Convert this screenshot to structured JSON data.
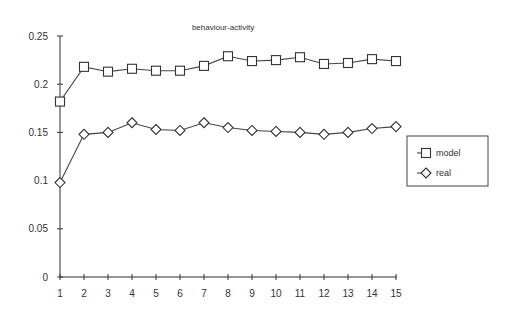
{
  "chart_data": {
    "type": "line",
    "title": "behaviour-activity",
    "xlabel": "",
    "ylabel": "",
    "x": [
      1,
      2,
      3,
      4,
      5,
      6,
      7,
      8,
      9,
      10,
      11,
      12,
      13,
      14,
      15
    ],
    "xlim": [
      1,
      15
    ],
    "ylim": [
      0,
      0.25
    ],
    "yticks": [
      0,
      0.05,
      0.1,
      0.15,
      0.2,
      0.25
    ],
    "ytick_labels": [
      "0",
      "0.05",
      "0.1",
      "0.15",
      "0.2",
      "0.25"
    ],
    "xtick_labels": [
      "1",
      "2",
      "3",
      "4",
      "5",
      "6",
      "7",
      "8",
      "9",
      "10",
      "11",
      "12",
      "13",
      "14",
      "15"
    ],
    "grid": false,
    "legend_position": "right",
    "series": [
      {
        "name": "model",
        "marker": "square",
        "values": [
          0.182,
          0.218,
          0.213,
          0.216,
          0.214,
          0.214,
          0.219,
          0.229,
          0.224,
          0.225,
          0.228,
          0.221,
          0.222,
          0.226,
          0.224
        ]
      },
      {
        "name": "real",
        "marker": "diamond",
        "values": [
          0.098,
          0.148,
          0.15,
          0.16,
          0.153,
          0.152,
          0.16,
          0.155,
          0.152,
          0.151,
          0.15,
          0.148,
          0.15,
          0.154,
          0.156
        ]
      }
    ]
  }
}
